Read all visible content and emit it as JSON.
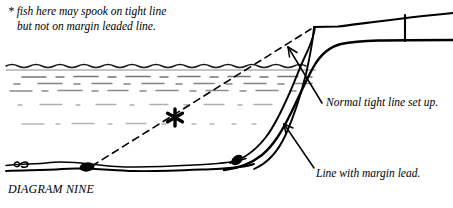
{
  "figure": {
    "caption": "DIAGRAM NINE",
    "note": {
      "line1": "* fish here may spook on tight line",
      "line2": "but not on margin leaded line."
    },
    "labels": {
      "normal_tight_line": "Normal tight line set up.",
      "margin_lead_line": "Line with margin lead."
    },
    "markers": {
      "asterisk": "*"
    },
    "colors": {
      "ink": "#000000",
      "background": "#ffffff",
      "water_texture": "#7a7a7a",
      "water_surface": "#2b2b2b"
    },
    "elements": [
      "water-surface-wavy-line",
      "water-texture-dashes",
      "lake-bed",
      "near-bank-slope",
      "tight-line",
      "margin-leaded-line",
      "dashed-line-of-sight",
      "lead-weight-bottom",
      "lead-weight-slope",
      "hookbait",
      "bank-stick",
      "rod"
    ]
  }
}
